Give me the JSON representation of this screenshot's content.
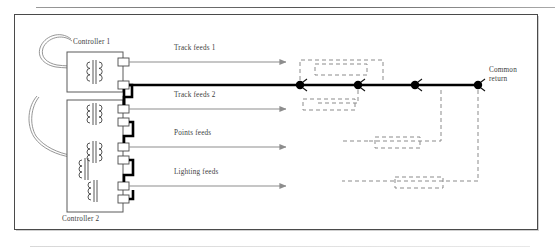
{
  "diagram": {
    "type": "electrical-schematic",
    "controllers": [
      {
        "id": "controller-1",
        "label": "Controller 1",
        "transformers": 1,
        "terminals": [
          "track-feed-1",
          "return-1"
        ]
      },
      {
        "id": "controller-2",
        "label": "Controller 2",
        "transformers": 3,
        "terminals": [
          "track-feed-2",
          "return-2",
          "points-feed",
          "return-3",
          "lighting-feed",
          "return-4"
        ]
      }
    ],
    "feeds": [
      {
        "id": "track-feeds-1",
        "label": "Track feeds 1",
        "label_x": 174,
        "label_y": 49,
        "line_y": 63,
        "x1": 143,
        "x2": 288
      },
      {
        "id": "track-feeds-2",
        "label": "Track feeds 2",
        "label_x": 174,
        "label_y": 95,
        "line_y": 109,
        "x1": 143,
        "x2": 288
      },
      {
        "id": "points-feeds",
        "label": "Points feeds",
        "label_x": 174,
        "label_y": 133,
        "line_y": 147,
        "x1": 143,
        "x2": 288
      },
      {
        "id": "lighting-feeds",
        "label": "Lighting feeds",
        "label_x": 174,
        "label_y": 172,
        "line_y": 186,
        "x1": 143,
        "x2": 288
      }
    ],
    "common_return": {
      "label_line_1": "Common",
      "label_line_2": "return",
      "label_x": 489,
      "label_y": 70,
      "bus_y": 86,
      "bus_x1": 128,
      "bus_x2": 478,
      "nodes": [
        {
          "id": "node-1",
          "x": 300,
          "y": 86
        },
        {
          "id": "node-2",
          "x": 358,
          "y": 86
        },
        {
          "id": "node-3",
          "x": 415,
          "y": 86
        },
        {
          "id": "node-4",
          "x": 478,
          "y": 86
        }
      ]
    },
    "colors": {
      "frame_border": "#4a4a4a",
      "bus_bold": "#000000",
      "feed_arrow": "#8d8d8d",
      "dashed_track": "#8b8b8b",
      "text": "#3c3c3c",
      "box_outline": "#5a5a5a"
    }
  }
}
